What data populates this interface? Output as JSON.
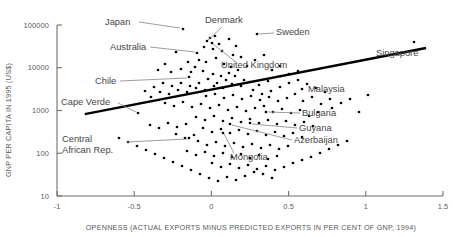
{
  "chart_data": {
    "type": "scatter",
    "title": "",
    "xlabel": "OPENNESS (ACTUAL EXPORTS MINUS PREDICTED EXPORTS IN PER CENT OF GNP, 1994)",
    "ylabel": "GNP PER CAPITA IN 1995 (US$)",
    "xlim": [
      -1,
      1.5
    ],
    "ylim": [
      10,
      100000
    ],
    "yscale": "log",
    "xscale": "linear",
    "grid": false,
    "legend": "none",
    "xticks": [
      -1,
      -0.5,
      0,
      0.5,
      1,
      1.5
    ],
    "xticklabels": [
      "-1",
      "-0.5",
      "0",
      "0.5",
      "1",
      "1.5"
    ],
    "yticks": [
      10,
      100,
      1000,
      10000,
      100000
    ],
    "yticklabels": [
      "10",
      "100",
      "1000",
      "10000",
      "100000"
    ],
    "point_color": "#000000",
    "trend_color": "#000000",
    "trendline": {
      "x0": -0.82,
      "y0": 820,
      "x1": 1.39,
      "y1": 29000
    },
    "annotations": [
      {
        "label": "Japan",
        "text_x": 105,
        "text_y": 25,
        "anchor": "start",
        "leader": [
          [
            139,
            22
          ],
          [
            180,
            28
          ]
        ],
        "point": [
          183,
          29
        ]
      },
      {
        "label": "Denmark",
        "text_x": 205,
        "text_y": 23,
        "anchor": "start",
        "leader": [
          [
            222,
            27
          ],
          [
            208,
            40
          ]
        ],
        "point": [
          207,
          41
        ]
      },
      {
        "label": "Sweden",
        "text_x": 276,
        "text_y": 35,
        "anchor": "start",
        "leader": [
          [
            274,
            33
          ],
          [
            259,
            34
          ]
        ],
        "point": [
          257,
          34
        ]
      },
      {
        "label": "Australia",
        "text_x": 110,
        "text_y": 50,
        "anchor": "start",
        "leader": [
          [
            150,
            47
          ],
          [
            195,
            52
          ]
        ],
        "point": [
          197,
          53
        ]
      },
      {
        "label": "United Kingdom",
        "text_x": 221,
        "text_y": 68,
        "anchor": "start",
        "leader": [
          [
            236,
            62
          ],
          [
            213,
            44
          ]
        ],
        "point": [
          212,
          43
        ]
      },
      {
        "label": "Singapore",
        "text_x": 376,
        "text_y": 56,
        "anchor": "start",
        "leader": [],
        "point": [
          414,
          42
        ]
      },
      {
        "label": "Chile",
        "text_x": 95,
        "text_y": 84,
        "anchor": "start",
        "leader": [
          [
            120,
            81
          ],
          [
            187,
            78
          ]
        ],
        "point": [
          189,
          77
        ]
      },
      {
        "label": "Malaysia",
        "text_x": 308,
        "text_y": 92,
        "anchor": "start",
        "leader": [],
        "point": [
          302,
          89
        ]
      },
      {
        "label": "Cape Verde",
        "text_x": 61,
        "text_y": 105,
        "anchor": "start",
        "leader": [
          [
            118,
            103
          ],
          [
            136,
            112
          ]
        ],
        "point": [
          138,
          113
        ]
      },
      {
        "label": "Bulgaria",
        "text_x": 302,
        "text_y": 116,
        "anchor": "start",
        "leader": [
          [
            300,
            113
          ],
          [
            268,
            112
          ]
        ],
        "point": [
          266,
          112
        ]
      },
      {
        "label": "Guyana",
        "text_x": 299,
        "text_y": 131,
        "anchor": "start",
        "leader": [
          [
            297,
            128
          ],
          [
            252,
            124
          ]
        ],
        "point": [
          250,
          123
        ]
      },
      {
        "label": "Central",
        "text_x": 62,
        "text_y": 142,
        "anchor": "start",
        "leader": [
          [
            127,
            142
          ],
          [
            187,
            139
          ]
        ],
        "point": [
          189,
          138
        ]
      },
      {
        "label": "African Rep.",
        "text_x": 62,
        "text_y": 153,
        "anchor": "start",
        "leader": [],
        "point": null
      },
      {
        "label": "Azerbaijan",
        "text_x": 294,
        "text_y": 143,
        "anchor": "start",
        "leader": [
          [
            292,
            140
          ],
          [
            232,
            125
          ]
        ],
        "point": [
          230,
          124
        ]
      },
      {
        "label": "Mongolia",
        "text_x": 230,
        "text_y": 160,
        "anchor": "start",
        "leader": [
          [
            234,
            153
          ],
          [
            224,
            134
          ]
        ],
        "point": [
          223,
          133
        ]
      }
    ],
    "points": [
      [
        183,
        29
      ],
      [
        207,
        41
      ],
      [
        257,
        34
      ],
      [
        197,
        53
      ],
      [
        212,
        43
      ],
      [
        414,
        42
      ],
      [
        189,
        77
      ],
      [
        302,
        89
      ],
      [
        138,
        113
      ],
      [
        266,
        112
      ],
      [
        250,
        123
      ],
      [
        189,
        138
      ],
      [
        230,
        124
      ],
      [
        223,
        133
      ],
      [
        210,
        38
      ],
      [
        215,
        36
      ],
      [
        219,
        44
      ],
      [
        204,
        47
      ],
      [
        213,
        49
      ],
      [
        222,
        51
      ],
      [
        229,
        39
      ],
      [
        236,
        46
      ],
      [
        233,
        55
      ],
      [
        241,
        57
      ],
      [
        199,
        60
      ],
      [
        206,
        62
      ],
      [
        216,
        58
      ],
      [
        224,
        64
      ],
      [
        231,
        67
      ],
      [
        195,
        67
      ],
      [
        188,
        62
      ],
      [
        176,
        52
      ],
      [
        165,
        64
      ],
      [
        158,
        70
      ],
      [
        171,
        72
      ],
      [
        181,
        69
      ],
      [
        191,
        72
      ],
      [
        203,
        71
      ],
      [
        213,
        74
      ],
      [
        221,
        76
      ],
      [
        229,
        73
      ],
      [
        238,
        70
      ],
      [
        247,
        66
      ],
      [
        255,
        60
      ],
      [
        264,
        55
      ],
      [
        272,
        70
      ],
      [
        280,
        66
      ],
      [
        289,
        74
      ],
      [
        298,
        71
      ],
      [
        268,
        81
      ],
      [
        259,
        85
      ],
      [
        250,
        82
      ],
      [
        241,
        86
      ],
      [
        232,
        84
      ],
      [
        223,
        88
      ],
      [
        214,
        86
      ],
      [
        205,
        90
      ],
      [
        196,
        88
      ],
      [
        187,
        92
      ],
      [
        178,
        90
      ],
      [
        169,
        94
      ],
      [
        160,
        92
      ],
      [
        151,
        97
      ],
      [
        206,
        96
      ],
      [
        215,
        94
      ],
      [
        224,
        98
      ],
      [
        233,
        95
      ],
      [
        242,
        99
      ],
      [
        251,
        96
      ],
      [
        260,
        100
      ],
      [
        269,
        97
      ],
      [
        278,
        101
      ],
      [
        287,
        98
      ],
      [
        295,
        94
      ],
      [
        303,
        101
      ],
      [
        312,
        97
      ],
      [
        321,
        104
      ],
      [
        330,
        99
      ],
      [
        165,
        103
      ],
      [
        174,
        106
      ],
      [
        183,
        102
      ],
      [
        192,
        107
      ],
      [
        201,
        104
      ],
      [
        210,
        108
      ],
      [
        219,
        105
      ],
      [
        228,
        110
      ],
      [
        237,
        107
      ],
      [
        246,
        111
      ],
      [
        255,
        108
      ],
      [
        264,
        106
      ],
      [
        273,
        112
      ],
      [
        282,
        109
      ],
      [
        291,
        113
      ],
      [
        300,
        110
      ],
      [
        309,
        116
      ],
      [
        318,
        112
      ],
      [
        196,
        117
      ],
      [
        205,
        120
      ],
      [
        214,
        116
      ],
      [
        223,
        121
      ],
      [
        232,
        118
      ],
      [
        241,
        122
      ],
      [
        250,
        119
      ],
      [
        259,
        123
      ],
      [
        268,
        120
      ],
      [
        277,
        124
      ],
      [
        286,
        121
      ],
      [
        295,
        125
      ],
      [
        304,
        122
      ],
      [
        313,
        126
      ],
      [
        186,
        124
      ],
      [
        177,
        127
      ],
      [
        168,
        123
      ],
      [
        159,
        128
      ],
      [
        150,
        125
      ],
      [
        203,
        128
      ],
      [
        212,
        132
      ],
      [
        221,
        129
      ],
      [
        230,
        133
      ],
      [
        239,
        130
      ],
      [
        248,
        134
      ],
      [
        257,
        131
      ],
      [
        266,
        135
      ],
      [
        275,
        132
      ],
      [
        284,
        136
      ],
      [
        293,
        133
      ],
      [
        302,
        137
      ],
      [
        194,
        135
      ],
      [
        185,
        138
      ],
      [
        176,
        134
      ],
      [
        198,
        141
      ],
      [
        207,
        145
      ],
      [
        216,
        142
      ],
      [
        225,
        146
      ],
      [
        234,
        143
      ],
      [
        243,
        147
      ],
      [
        252,
        144
      ],
      [
        261,
        148
      ],
      [
        270,
        145
      ],
      [
        279,
        149
      ],
      [
        288,
        146
      ],
      [
        205,
        152
      ],
      [
        214,
        156
      ],
      [
        223,
        153
      ],
      [
        232,
        157
      ],
      [
        241,
        154
      ],
      [
        250,
        158
      ],
      [
        259,
        155
      ],
      [
        268,
        159
      ],
      [
        277,
        156
      ],
      [
        196,
        155
      ],
      [
        187,
        151
      ],
      [
        212,
        163
      ],
      [
        221,
        167
      ],
      [
        230,
        164
      ],
      [
        239,
        168
      ],
      [
        248,
        165
      ],
      [
        257,
        169
      ],
      [
        266,
        166
      ],
      [
        275,
        170
      ],
      [
        284,
        167
      ],
      [
        293,
        163
      ],
      [
        302,
        160
      ],
      [
        311,
        157
      ],
      [
        320,
        153
      ],
      [
        329,
        149
      ],
      [
        338,
        145
      ],
      [
        347,
        141
      ],
      [
        263,
        174
      ],
      [
        272,
        178
      ],
      [
        245,
        176
      ],
      [
        254,
        172
      ],
      [
        236,
        180
      ],
      [
        227,
        177
      ],
      [
        218,
        181
      ],
      [
        209,
        178
      ],
      [
        200,
        174
      ],
      [
        191,
        170
      ],
      [
        182,
        166
      ],
      [
        173,
        162
      ],
      [
        164,
        158
      ],
      [
        155,
        154
      ],
      [
        146,
        150
      ],
      [
        137,
        146
      ],
      [
        128,
        142
      ],
      [
        119,
        138
      ],
      [
        332,
        108
      ],
      [
        341,
        103
      ],
      [
        350,
        99
      ],
      [
        359,
        112
      ],
      [
        368,
        95
      ],
      [
        325,
        92
      ],
      [
        316,
        88
      ],
      [
        307,
        84
      ],
      [
        298,
        80
      ],
      [
        289,
        83
      ],
      [
        280,
        87
      ],
      [
        271,
        91
      ],
      [
        262,
        94
      ],
      [
        253,
        90
      ],
      [
        244,
        80
      ],
      [
        235,
        76
      ],
      [
        226,
        80
      ],
      [
        217,
        83
      ],
      [
        208,
        79
      ],
      [
        199,
        83
      ],
      [
        190,
        86
      ],
      [
        181,
        83
      ],
      [
        172,
        86
      ],
      [
        163,
        83
      ],
      [
        154,
        87
      ],
      [
        145,
        91
      ]
    ]
  },
  "axes": {
    "x_title": "OPENNESS (ACTUAL EXPORTS MINUS PREDICTED EXPORTS IN PER CENT OF GNP, 1994)",
    "y_title": "GNP PER CAPITA IN 1995 (US$)"
  }
}
